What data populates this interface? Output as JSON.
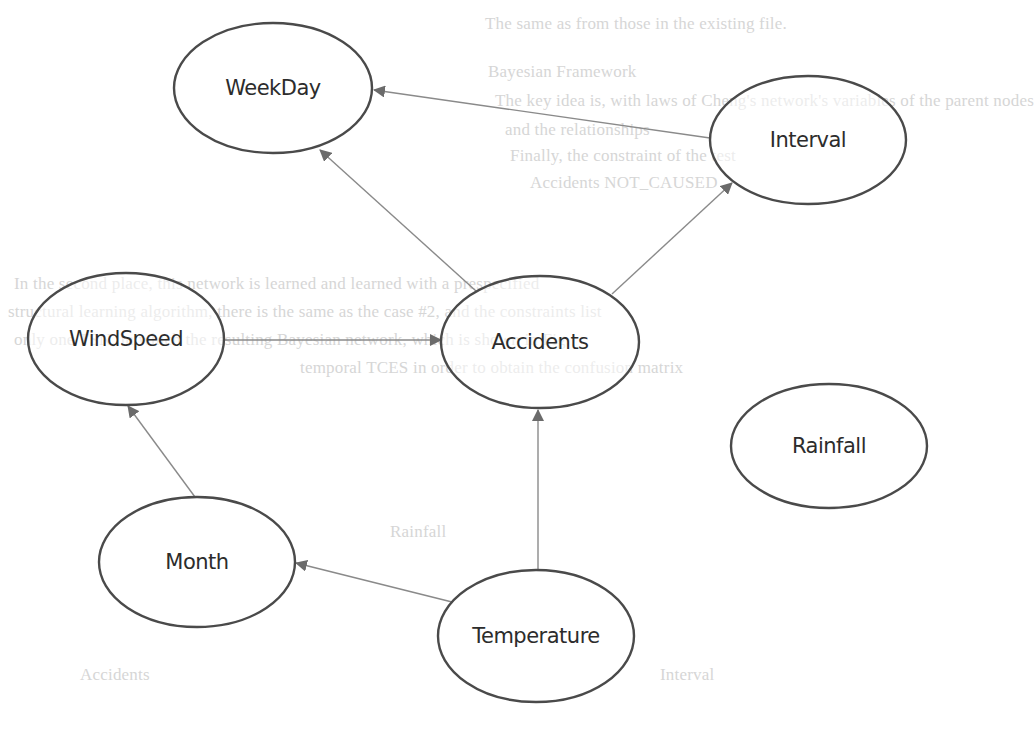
{
  "diagram": {
    "type": "bayesian-network",
    "colors": {
      "background": "#ffffff",
      "node_stroke": "#4a4a4a",
      "node_text": "#2c2c2c",
      "edge": "#8a8a8a",
      "arrowhead": "#6b6b6b",
      "bleed_text": "#d6d6d6"
    },
    "nodes": [
      {
        "id": "weekday",
        "label": "WeekDay",
        "cx": 273,
        "cy": 88,
        "rx": 99,
        "ry": 65
      },
      {
        "id": "interval",
        "label": "Interval",
        "cx": 808,
        "cy": 140,
        "rx": 98,
        "ry": 64
      },
      {
        "id": "windspeed",
        "label": "WindSpeed",
        "cx": 126,
        "cy": 339,
        "rx": 98,
        "ry": 66
      },
      {
        "id": "accidents",
        "label": "Accidents",
        "cx": 540,
        "cy": 342,
        "rx": 99,
        "ry": 66
      },
      {
        "id": "rainfall",
        "label": "Rainfall",
        "cx": 829,
        "cy": 446,
        "rx": 98,
        "ry": 62
      },
      {
        "id": "month",
        "label": "Month",
        "cx": 197,
        "cy": 562,
        "rx": 98,
        "ry": 65
      },
      {
        "id": "temperature",
        "label": "Temperature",
        "cx": 536,
        "cy": 636,
        "rx": 98,
        "ry": 66
      }
    ],
    "edges": [
      {
        "from": "interval",
        "to": "weekday",
        "x1": 710,
        "y1": 138,
        "x2": 374,
        "y2": 90
      },
      {
        "from": "accidents",
        "to": "weekday",
        "x1": 476,
        "y1": 291,
        "x2": 320,
        "y2": 150
      },
      {
        "from": "accidents",
        "to": "interval",
        "x1": 612,
        "y1": 294,
        "x2": 732,
        "y2": 183
      },
      {
        "from": "windspeed",
        "to": "accidents",
        "x1": 225,
        "y1": 340,
        "x2": 441,
        "y2": 340
      },
      {
        "from": "month",
        "to": "windspeed",
        "x1": 195,
        "y1": 497,
        "x2": 128,
        "y2": 406
      },
      {
        "from": "temperature",
        "to": "month",
        "x1": 452,
        "y1": 602,
        "x2": 296,
        "y2": 563
      },
      {
        "from": "temperature",
        "to": "accidents",
        "x1": 538,
        "y1": 570,
        "x2": 538,
        "y2": 410
      }
    ],
    "isolated_nodes": [
      "Rainfall"
    ]
  },
  "background_bleed_text": [
    {
      "text": "The same as from those in the existing file.",
      "x": 485,
      "y": 24
    },
    {
      "text": "Bayesian Framework",
      "x": 488,
      "y": 72
    },
    {
      "text": "The key idea is, with laws of Cheng's network's variables of the parent nodes",
      "x": 495,
      "y": 101
    },
    {
      "text": "and the relationships",
      "x": 505,
      "y": 130
    },
    {
      "text": "Finally, the constraint of the test",
      "x": 510,
      "y": 156
    },
    {
      "text": "Accidents NOT_CAUSED",
      "x": 530,
      "y": 183
    },
    {
      "text": "In the second place, this network is learned and learned with a prespecified",
      "x": 14,
      "y": 284
    },
    {
      "text": "structural learning algorithm, there is the same as the case #2, and the constraints list",
      "x": 8,
      "y": 312
    },
    {
      "text": "only one TSN, in which the resulting Bayesian network, which is shown in Fig.",
      "x": 14,
      "y": 340
    },
    {
      "text": "temporal TCES in order to obtain the confusion matrix",
      "x": 300,
      "y": 368
    },
    {
      "text": "Rainfall",
      "x": 390,
      "y": 532
    },
    {
      "text": "Interval",
      "x": 660,
      "y": 675
    },
    {
      "text": "Accidents",
      "x": 80,
      "y": 675
    }
  ]
}
